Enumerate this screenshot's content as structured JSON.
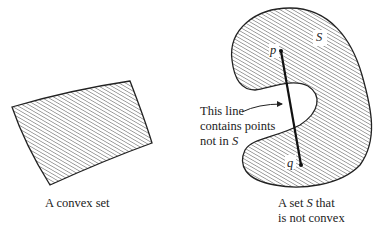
{
  "figure": {
    "convex": {
      "caption": "A convex set"
    },
    "nonconvex": {
      "set_name": "S",
      "point_p": "p",
      "point_q": "q",
      "annotation_line1": "This line",
      "annotation_line2": "contains points",
      "annotation_line3_prefix": "not in ",
      "annotation_line3_set": "S",
      "caption_line1_prefix": "A set ",
      "caption_line1_set": "S",
      "caption_line1_suffix": " that",
      "caption_line2": "is not convex"
    }
  },
  "colors": {
    "outline": "#222222",
    "hatch": "#444444",
    "background": "#ffffff"
  }
}
